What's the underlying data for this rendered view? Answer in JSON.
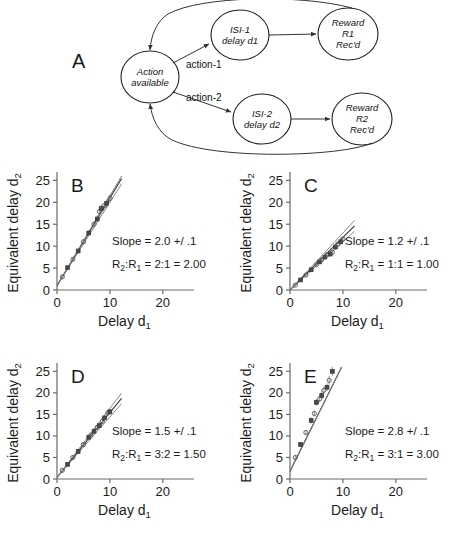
{
  "figure": {
    "background": "#ffffff",
    "ink_color": "#1a1a1a"
  },
  "diagram": {
    "letter": "A",
    "nodes": [
      {
        "id": "action",
        "label_lines": [
          "Action",
          "available"
        ],
        "cx": 150,
        "cy": 77,
        "rx": 29,
        "ry": 26
      },
      {
        "id": "isi1",
        "label_lines": [
          "ISI-1",
          "delay d1"
        ],
        "cx": 240,
        "cy": 35,
        "rx": 29,
        "ry": 25
      },
      {
        "id": "reward1",
        "label_lines": [
          "Reward",
          "R1",
          "Rec'd"
        ],
        "cx": 348,
        "cy": 34,
        "rx": 30,
        "ry": 26
      },
      {
        "id": "isi2",
        "label_lines": [
          "ISI-2",
          "delay d2"
        ],
        "cx": 262,
        "cy": 119,
        "rx": 29,
        "ry": 25
      },
      {
        "id": "reward2",
        "label_lines": [
          "Reward",
          "R2",
          "Rec'd"
        ],
        "cx": 362,
        "cy": 119,
        "rx": 30,
        "ry": 26
      }
    ],
    "edge_labels": [
      {
        "id": "action-1",
        "text": "action-1",
        "x": 186,
        "y": 68
      },
      {
        "id": "action-2",
        "text": "action-2",
        "x": 186,
        "y": 101
      }
    ]
  },
  "panels": [
    {
      "letter": "B",
      "slope_text": "Slope = 2.0 +/ .1",
      "ratio_text_pre": "R",
      "ratio_sub_2": "2",
      "ratio_mid": ":R",
      "ratio_sub_1": "1",
      "ratio_post": " = 2:1 = 2.00",
      "chart_data": {
        "type": "scatter",
        "title": "B",
        "xlabel": "Delay d1",
        "ylabel": "Equivalent delay d2",
        "xlim": [
          0,
          24
        ],
        "ylim": [
          0,
          26
        ],
        "xticks": [
          0,
          10,
          20
        ],
        "yticks": [
          0,
          5,
          10,
          15,
          20,
          25
        ],
        "grid": false,
        "fit_slope": 2.0,
        "fit_slope_err": 0.1,
        "fit_intercept": 1.0,
        "reward_ratio": "2:1",
        "reward_ratio_value": 2.0,
        "x": [
          1.0,
          2.0,
          3.0,
          4.0,
          5.0,
          6.0,
          7.0,
          7.6,
          8.0,
          8.4,
          9.0,
          9.4,
          10.0
        ],
        "y": [
          3.0,
          5.1,
          7.0,
          8.9,
          11.0,
          13.0,
          15.0,
          16.2,
          17.9,
          18.6,
          19.3,
          19.8,
          20.9
        ],
        "yerr": [
          0.4,
          0.4,
          0.4,
          0.5,
          0.5,
          0.6,
          0.7,
          0.8,
          0.9,
          0.9,
          0.9,
          0.9,
          0.9
        ]
      }
    },
    {
      "letter": "C",
      "slope_text": "Slope = 1.2 +/ .1",
      "ratio_text_pre": "R",
      "ratio_sub_2": "2",
      "ratio_mid": ":R",
      "ratio_sub_1": "1",
      "ratio_post": " = 1:1 = 1.00",
      "chart_data": {
        "type": "scatter",
        "title": "C",
        "xlabel": "Delay d1",
        "ylabel": "Equivalent delay d2",
        "xlim": [
          0,
          24
        ],
        "ylim": [
          0,
          26
        ],
        "xticks": [
          0,
          10,
          20
        ],
        "yticks": [
          0,
          5,
          10,
          15,
          20,
          25
        ],
        "grid": false,
        "fit_slope": 1.2,
        "fit_slope_err": 0.1,
        "fit_intercept": 0.0,
        "reward_ratio": "1:1",
        "reward_ratio_value": 1.0,
        "x": [
          1.0,
          2.0,
          3.0,
          4.0,
          5.0,
          5.6,
          6.0,
          6.6,
          7.0,
          7.6,
          8.0,
          8.6,
          9.0,
          9.6,
          10.0
        ],
        "y": [
          1.1,
          2.3,
          3.4,
          4.6,
          5.8,
          6.4,
          6.9,
          7.5,
          8.0,
          8.2,
          8.6,
          9.8,
          10.4,
          11.0,
          11.6
        ],
        "yerr": [
          0.3,
          0.3,
          0.3,
          0.4,
          0.4,
          0.4,
          0.5,
          0.5,
          0.5,
          0.6,
          0.6,
          0.6,
          0.7,
          0.7,
          0.7
        ]
      }
    },
    {
      "letter": "D",
      "slope_text": "Slope = 1.5 +/ .1",
      "ratio_text_pre": "R",
      "ratio_sub_2": "2",
      "ratio_mid": ":R",
      "ratio_sub_1": "1",
      "ratio_post": " = 3:2 = 1.50",
      "chart_data": {
        "type": "scatter",
        "title": "D",
        "xlabel": "Delay d1",
        "ylabel": "Equivalent delay d2",
        "xlim": [
          0,
          24
        ],
        "ylim": [
          0,
          26
        ],
        "xticks": [
          0,
          10,
          20
        ],
        "yticks": [
          0,
          5,
          10,
          15,
          20,
          25
        ],
        "grid": false,
        "fit_slope": 1.5,
        "fit_slope_err": 0.1,
        "fit_intercept": 0.4,
        "reward_ratio": "3:2",
        "reward_ratio_value": 1.5,
        "x": [
          1.0,
          2.0,
          3.0,
          4.0,
          5.0,
          6.0,
          6.4,
          7.0,
          7.6,
          8.0,
          8.6,
          9.0,
          9.6,
          10.0
        ],
        "y": [
          2.0,
          3.4,
          5.0,
          6.4,
          8.0,
          9.7,
          10.2,
          11.1,
          12.0,
          12.4,
          13.4,
          14.2,
          15.4,
          15.6
        ],
        "yerr": [
          0.3,
          0.3,
          0.4,
          0.4,
          0.5,
          0.5,
          0.5,
          0.6,
          0.6,
          0.6,
          0.7,
          0.7,
          0.7,
          0.7
        ]
      }
    },
    {
      "letter": "E",
      "slope_text": "Slope = 2.8 +/ .1",
      "ratio_text_pre": "R",
      "ratio_sub_2": "2",
      "ratio_mid": ":R",
      "ratio_sub_1": "1",
      "ratio_post": " = 3:1 = 3.00",
      "chart_data": {
        "type": "scatter",
        "title": "E",
        "xlabel": "Delay d1",
        "ylabel": "Equivalent delay d2",
        "xlim": [
          0,
          24
        ],
        "ylim": [
          0,
          26
        ],
        "xticks": [
          0,
          10,
          20
        ],
        "yticks": [
          0,
          5,
          10,
          15,
          20,
          25
        ],
        "grid": false,
        "fit_slope": 2.8,
        "fit_slope_err": 0.1,
        "fit_intercept": 1.8,
        "reward_ratio": "3:1",
        "reward_ratio_value": 3.0,
        "x": [
          1.0,
          2.0,
          3.0,
          4.0,
          4.6,
          5.0,
          5.6,
          6.0,
          6.4,
          7.0,
          7.4,
          8.0
        ],
        "y": [
          5.0,
          8.0,
          10.8,
          13.6,
          15.2,
          17.8,
          18.6,
          19.4,
          20.6,
          21.3,
          22.9,
          25.0
        ],
        "yerr": [
          0.5,
          0.5,
          0.6,
          0.7,
          0.7,
          0.8,
          0.8,
          0.9,
          0.9,
          0.9,
          1.0,
          1.0
        ]
      }
    }
  ],
  "axis_labels": {
    "x_main": "Delay d",
    "x_sub": "1",
    "y_main": "Equivalent delay d",
    "y_sub": "2"
  },
  "tick_text": {
    "y": [
      "25",
      "20",
      "15",
      "10",
      "5",
      "0"
    ],
    "x": [
      "0",
      "10",
      "20"
    ]
  }
}
